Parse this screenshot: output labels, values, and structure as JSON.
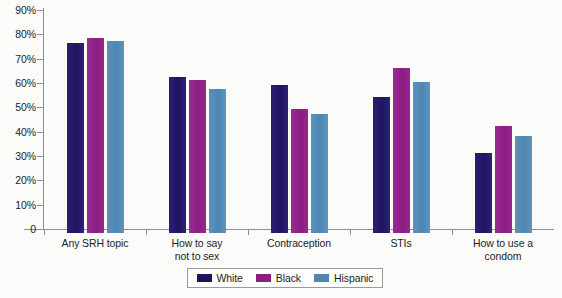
{
  "chart_data": {
    "type": "bar",
    "title": "",
    "subtitle": "",
    "xlabel": "",
    "ylabel": "",
    "ylim": [
      0,
      90
    ],
    "grid": false,
    "legend_position": "bottom",
    "categories": [
      "Any SRH topic",
      "How to say not to sex",
      "Contraception",
      "STIs",
      "How to use a condom"
    ],
    "category_lines": [
      [
        "Any SRH topic"
      ],
      [
        "How to say",
        "not to sex"
      ],
      [
        "Contraception"
      ],
      [
        "STIs"
      ],
      [
        "How to use a",
        "condom"
      ]
    ],
    "series": [
      {
        "name": "White",
        "color": "#1e1560",
        "values": [
          78,
          64,
          61,
          56,
          33
        ]
      },
      {
        "name": "Black",
        "color": "#8c1f82",
        "values": [
          80,
          63,
          51,
          68,
          44
        ]
      },
      {
        "name": "Hispanic",
        "color": "#4e86b2",
        "values": [
          79,
          59,
          49,
          62,
          40
        ]
      }
    ],
    "ytick_labels": [
      "90%",
      "80%",
      "70%",
      "60%",
      "50%",
      "40%",
      "30%",
      "20%",
      "10%",
      "0"
    ],
    "ytick_values": [
      90,
      80,
      70,
      60,
      50,
      40,
      30,
      20,
      10,
      0
    ]
  },
  "legend": {
    "items": [
      {
        "label": "White"
      },
      {
        "label": "Black"
      },
      {
        "label": "Hispanic"
      }
    ]
  }
}
